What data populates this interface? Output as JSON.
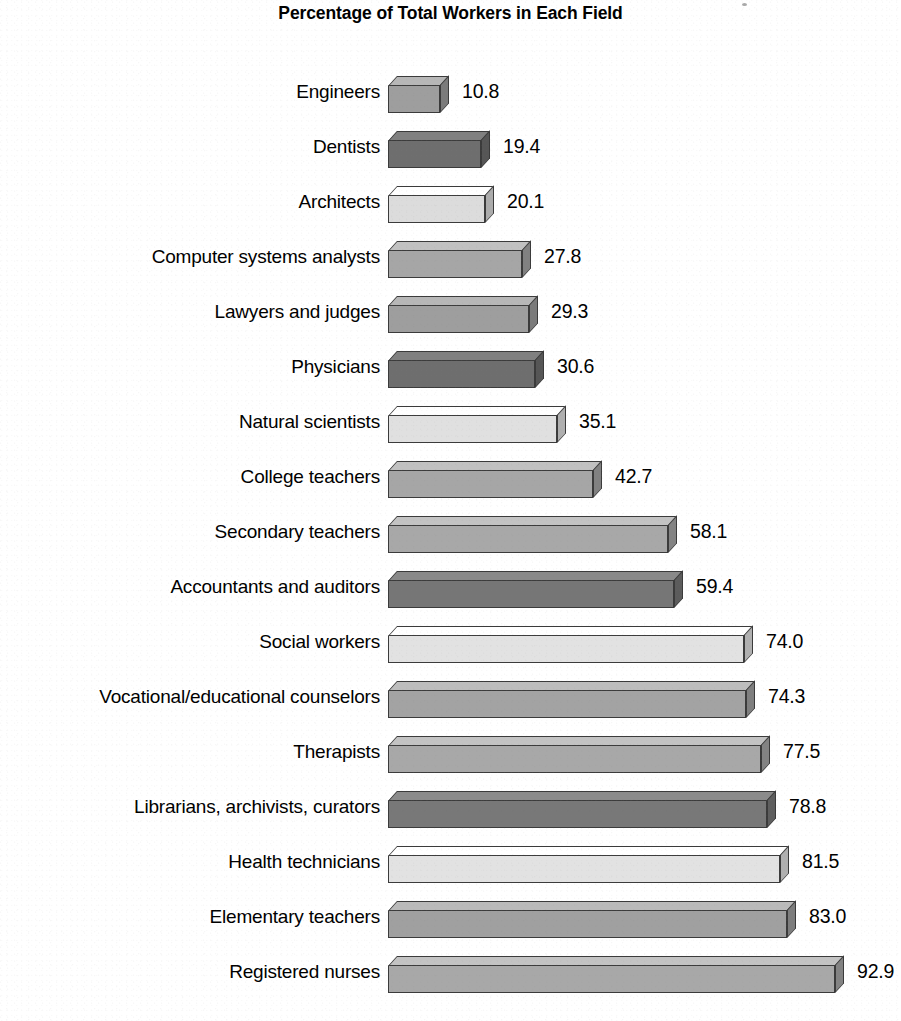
{
  "chart_data": {
    "type": "bar",
    "orientation": "horizontal",
    "title": "Percentage of Total Workers in Each Field",
    "subtitle": "",
    "xlabel": "",
    "ylabel": "",
    "xlim": [
      0,
      92.9
    ],
    "grid": false,
    "legend": "none",
    "value_label_format": "one-decimal",
    "categories": [
      "Engineers",
      "Dentists",
      "Architects",
      "Computer systems analysts",
      "Lawyers and judges",
      "Physicians",
      "Natural scientists",
      "College teachers",
      "Secondary teachers",
      "Accountants and auditors",
      "Social workers",
      "Vocational/educational counselors",
      "Therapists",
      "Librarians, archivists, curators",
      "Health technicians",
      "Elementary teachers",
      "Registered nurses"
    ],
    "values": [
      10.8,
      19.4,
      20.1,
      27.8,
      29.3,
      30.6,
      35.1,
      42.7,
      58.1,
      59.4,
      74.0,
      74.3,
      77.5,
      78.8,
      81.5,
      83.0,
      92.9
    ],
    "value_labels": [
      "10.8",
      "19.4",
      "20.1",
      "27.8",
      "29.3",
      "30.6",
      "35.1",
      "42.7",
      "58.1",
      "59.4",
      "74.0",
      "74.3",
      "77.5",
      "78.8",
      "81.5",
      "83.0",
      "92.9"
    ],
    "bar_fills": [
      "#9e9e9e",
      "#6e6e6e",
      "#dcdcdc",
      "#a6a6a6",
      "#9e9e9e",
      "#6e6e6e",
      "#e0e0e0",
      "#a6a6a6",
      "#a8a8a8",
      "#767676",
      "#e2e2e2",
      "#a3a3a3",
      "#a8a8a8",
      "#787878",
      "#e2e2e2",
      "#a0a0a0",
      "#a8a8a8"
    ]
  },
  "colors": {
    "background": "#ffffff",
    "text": "#000000",
    "bar_outline": "#3b3b3b",
    "gray_medium": "#9e9e9e",
    "gray_dark": "#6e6e6e",
    "gray_light": "#dcdcdc"
  }
}
